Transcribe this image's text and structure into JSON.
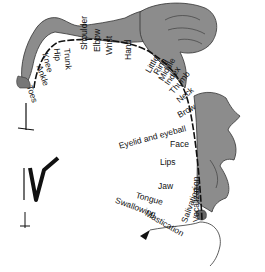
{
  "diagram": {
    "colors": {
      "figure_fill": "#8c8c8c",
      "figure_stroke": "#333333",
      "line": "#111111",
      "background": "#ffffff"
    },
    "labels": [
      {
        "id": "toes",
        "text": "Toes",
        "x": 33,
        "y": 84,
        "rot": 70
      },
      {
        "id": "ankle",
        "text": "Ankle",
        "x": 43,
        "y": 64,
        "rot": 70
      },
      {
        "id": "knee",
        "text": "Knee",
        "x": 49,
        "y": 52,
        "rot": 75
      },
      {
        "id": "hip",
        "text": "Hip",
        "x": 61,
        "y": 48,
        "rot": 85
      },
      {
        "id": "trunk",
        "text": "Trunk",
        "x": 71,
        "y": 48,
        "rot": 85
      },
      {
        "id": "shoulder",
        "text": "Shoulder",
        "x": 80,
        "y": 50,
        "rot": 270
      },
      {
        "id": "elbow",
        "text": "Elbow",
        "x": 93,
        "y": 52,
        "rot": 270
      },
      {
        "id": "wrist",
        "text": "Wrist",
        "x": 105,
        "y": 55,
        "rot": 270
      },
      {
        "id": "hand",
        "text": "Hand",
        "x": 124,
        "y": 60,
        "rot": 270
      },
      {
        "id": "little",
        "text": "Little",
        "x": 144,
        "y": 70,
        "rot": 300
      },
      {
        "id": "ring",
        "text": "Ring",
        "x": 152,
        "y": 72,
        "rot": 300
      },
      {
        "id": "middle",
        "text": "Middle",
        "x": 157,
        "y": 78,
        "rot": 300
      },
      {
        "id": "index",
        "text": "Index",
        "x": 163,
        "y": 82,
        "rot": 305
      },
      {
        "id": "thumb",
        "text": "Thumb",
        "x": 168,
        "y": 90,
        "rot": 310
      },
      {
        "id": "neck",
        "text": "Neck",
        "x": 175,
        "y": 98,
        "rot": 320
      },
      {
        "id": "brow",
        "text": "Brow",
        "x": 176,
        "y": 112,
        "rot": 330
      },
      {
        "id": "eyelid",
        "text": "Eyelid and eyeball",
        "x": 118,
        "y": 142,
        "rot": 345
      },
      {
        "id": "face",
        "text": "Face",
        "x": 170,
        "y": 140,
        "rot": 0
      },
      {
        "id": "lips",
        "text": "Lips",
        "x": 160,
        "y": 158,
        "rot": 0
      },
      {
        "id": "jaw",
        "text": "Jaw",
        "x": 158,
        "y": 182,
        "rot": 0
      },
      {
        "id": "tongue",
        "text": "Tongue",
        "x": 137,
        "y": 191,
        "rot": 15
      },
      {
        "id": "swallowing",
        "text": "Swallowing",
        "x": 117,
        "y": 196,
        "rot": 20
      },
      {
        "id": "mastication",
        "text": "Mastication",
        "x": 148,
        "y": 209,
        "rot": 30
      },
      {
        "id": "salivation",
        "text": "Salivation",
        "x": 180,
        "y": 221,
        "rot": 290
      },
      {
        "id": "vocalization",
        "text": "Vocalization",
        "x": 192,
        "y": 222,
        "rot": 270
      }
    ]
  }
}
